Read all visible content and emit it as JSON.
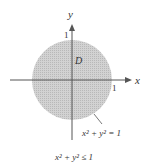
{
  "diagram": {
    "region_label": "D",
    "x_axis_label": "x",
    "y_axis_label": "y",
    "x_tick_label": "1",
    "y_tick_label": "1",
    "boundary_label": "x² + y² = 1",
    "region_caption": "x² + y² ≤ 1",
    "colors": {
      "fill": "#c8c8c8",
      "axis": "#555555",
      "text": "#333333"
    }
  }
}
